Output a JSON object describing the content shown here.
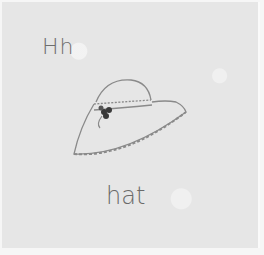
{
  "image": {
    "subject": "embroidered quilt block",
    "letters": "Hh",
    "word": "hat",
    "illustration": "wide-brim hat with flower band",
    "colors": {
      "fabric": "#e6e6e6",
      "thread": "#6e6e6e",
      "flower": "#3a3a3a"
    }
  }
}
